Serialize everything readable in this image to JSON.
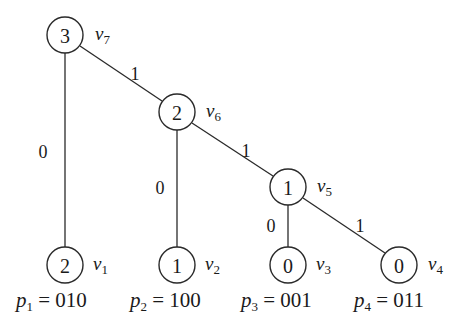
{
  "diagram": {
    "type": "binary-tree",
    "nodes": [
      {
        "id": "v7",
        "name": "v",
        "sub": "7",
        "value": "3",
        "x": 65,
        "y": 35
      },
      {
        "id": "v6",
        "name": "v",
        "sub": "6",
        "value": "2",
        "x": 177,
        "y": 112
      },
      {
        "id": "v5",
        "name": "v",
        "sub": "5",
        "value": "1",
        "x": 288,
        "y": 187
      },
      {
        "id": "v1",
        "name": "v",
        "sub": "1",
        "value": "2",
        "x": 65,
        "y": 265
      },
      {
        "id": "v2",
        "name": "v",
        "sub": "2",
        "value": "1",
        "x": 177,
        "y": 265
      },
      {
        "id": "v3",
        "name": "v",
        "sub": "3",
        "value": "0",
        "x": 288,
        "y": 265
      },
      {
        "id": "v4",
        "name": "v",
        "sub": "4",
        "value": "0",
        "x": 399,
        "y": 265
      }
    ],
    "edges": [
      {
        "from": "v7",
        "to": "v1",
        "label": "0",
        "lx": 43,
        "ly": 152
      },
      {
        "from": "v7",
        "to": "v6",
        "label": "1",
        "lx": 135,
        "ly": 74
      },
      {
        "from": "v6",
        "to": "v2",
        "label": "0",
        "lx": 160,
        "ly": 188
      },
      {
        "from": "v6",
        "to": "v5",
        "label": "1",
        "lx": 246,
        "ly": 151
      },
      {
        "from": "v5",
        "to": "v3",
        "label": "0",
        "lx": 271,
        "ly": 226
      },
      {
        "from": "v5",
        "to": "v4",
        "label": "1",
        "lx": 360,
        "ly": 226
      }
    ],
    "paths": [
      {
        "var": "p",
        "sub": "1",
        "eq": " = ",
        "code": "010",
        "x": 10
      },
      {
        "var": "p",
        "sub": "2",
        "eq": " = ",
        "code": "100",
        "x": 128
      },
      {
        "var": "p",
        "sub": "3",
        "eq": " = ",
        "code": "001",
        "x": 238
      },
      {
        "var": "p",
        "sub": "4",
        "eq": " = ",
        "code": "011",
        "x": 352
      }
    ]
  }
}
